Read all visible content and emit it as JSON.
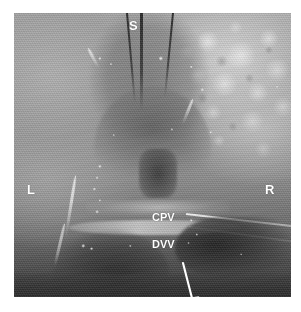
{
  "figure": {
    "modality": "grayscale ultrasound scan",
    "background_color": "#ffffff",
    "plate_color": "#8e8e8e"
  },
  "annotations": {
    "superior": {
      "text": "S",
      "name": "label-superior"
    },
    "left": {
      "text": "L",
      "name": "label-left"
    },
    "right": {
      "text": "R",
      "name": "label-right"
    },
    "cpv": {
      "text": "CPV",
      "name": "label-cpv"
    },
    "dvv": {
      "text": "DVV",
      "name": "label-dvv"
    }
  },
  "markers": {
    "arrow": {
      "name": "dvv-arrow",
      "color": "#ffffff",
      "direction": "down"
    }
  }
}
